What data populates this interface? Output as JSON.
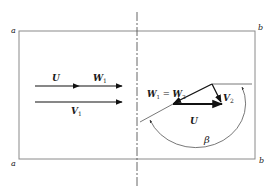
{
  "figure": {
    "corner_labels": {
      "top_left": "a",
      "bottom_left": "a",
      "top_right": "b",
      "bottom_right": "b"
    },
    "inlet": {
      "u_label": "U",
      "w1_label": "W",
      "w1_sub": "1",
      "v1_label": "V",
      "v1_sub": "1"
    },
    "outlet": {
      "w_eq_label_a": "W",
      "w_eq_sub_a": "1",
      "w_eq_mid": " = ",
      "w_eq_label_b": "W",
      "w_eq_sub_b": "2",
      "v2_label": "V",
      "v2_sub": "2",
      "u_label": "U",
      "angle_label": "β"
    },
    "colors": {
      "frame": "#8a8a8a",
      "vector": "#111111",
      "thin": "#555555"
    }
  }
}
